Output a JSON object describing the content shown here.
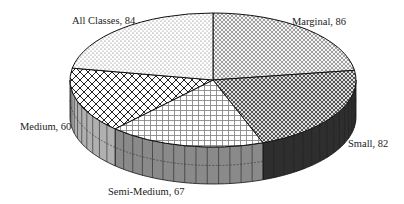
{
  "chart_data": {
    "type": "pie",
    "style": "3d",
    "title": "",
    "start": "12 o'clock",
    "direction": "clockwise",
    "slices": [
      {
        "label": "Marginal",
        "value": 86,
        "data_label": "Marginal, 86",
        "pattern": "small-diamond",
        "side_color": "#4a4a4a"
      },
      {
        "label": "Small",
        "value": 82,
        "data_label": "Small, 82",
        "pattern": "checker",
        "side_color": "#2e2e2e"
      },
      {
        "label": "Semi-Medium",
        "value": 67,
        "data_label": "Semi-Medium, 67",
        "pattern": "grid",
        "side_color": "#8a8a8a"
      },
      {
        "label": "Medium",
        "value": 60,
        "data_label": "Medium, 60",
        "pattern": "diagonal-cross",
        "side_color": "#b0b0b0"
      },
      {
        "label": "All Classes",
        "value": 84,
        "data_label": "All Classes, 84",
        "pattern": "dots",
        "side_color": "#d0d0d0"
      }
    ],
    "legend": "none"
  }
}
